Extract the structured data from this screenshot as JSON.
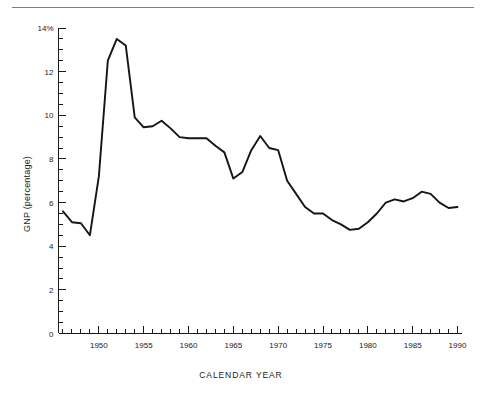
{
  "figure": {
    "has_top_rule": true,
    "background_color": "#ffffff",
    "line_color": "#141414",
    "axis_color": "#1a1a1a"
  },
  "chart_data": {
    "type": "line",
    "title": "",
    "subtitle": "",
    "xlabel": "CALENDAR YEAR",
    "ylabel": "GNP (percentage)",
    "xlim": [
      1945.5,
      1990.5
    ],
    "ylim": [
      0,
      14
    ],
    "grid": false,
    "legend": null,
    "x_major_ticks": [
      1950,
      1955,
      1960,
      1965,
      1970,
      1975,
      1980,
      1985,
      1990
    ],
    "x_major_tick_labels": [
      "1950",
      "1955",
      "1960",
      "1965",
      "1970",
      "1975",
      "1980",
      "1985",
      "1990"
    ],
    "x_minor_tick_interval": 1,
    "y_major_ticks": [
      0,
      2,
      4,
      6,
      8,
      10,
      12,
      14
    ],
    "y_major_tick_labels": [
      "0",
      "2",
      "4",
      "6",
      "8",
      "10",
      "12",
      "14%"
    ],
    "y_minor_tick_interval": 0.5,
    "series": [
      {
        "name": "GNP percentage",
        "x": [
          1946,
          1947,
          1948,
          1949,
          1950,
          1951,
          1952,
          1953,
          1954,
          1955,
          1956,
          1957,
          1958,
          1959,
          1960,
          1961,
          1962,
          1963,
          1964,
          1965,
          1966,
          1967,
          1968,
          1969,
          1970,
          1971,
          1972,
          1973,
          1974,
          1975,
          1976,
          1977,
          1978,
          1979,
          1980,
          1981,
          1982,
          1983,
          1984,
          1985,
          1986,
          1987,
          1988,
          1989,
          1990
        ],
        "values": [
          5.6,
          5.1,
          5.05,
          4.5,
          7.2,
          12.5,
          13.5,
          13.2,
          9.9,
          9.45,
          9.5,
          9.75,
          9.4,
          9.0,
          8.95,
          8.95,
          8.95,
          8.6,
          8.3,
          7.1,
          7.4,
          8.4,
          9.05,
          8.5,
          8.4,
          7.0,
          6.4,
          5.8,
          5.5,
          5.5,
          5.2,
          5.0,
          4.75,
          4.8,
          5.1,
          5.5,
          6.0,
          6.15,
          6.05,
          6.2,
          6.5,
          6.4,
          6.0,
          5.75,
          5.8
        ],
        "color": "#141414",
        "marker": "none"
      }
    ]
  },
  "bottom_caption": {
    "visible_text": "",
    "note": "cut-off faint text row at bottom edge, illegible"
  }
}
